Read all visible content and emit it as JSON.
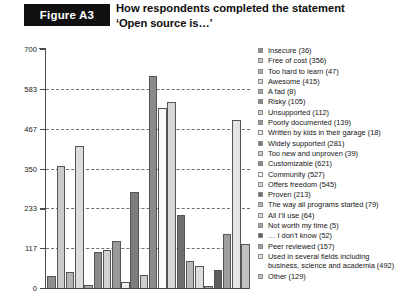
{
  "header": {
    "figure_label": "Figure A3",
    "title_line1": "How respondents completed the statement",
    "title_line2": "‘Open source is…’"
  },
  "chart_data": {
    "type": "bar",
    "title": "How respondents completed the statement ‘Open source is…’",
    "xlabel": "",
    "ylabel": "",
    "ylim": [
      0,
      700
    ],
    "yticks": [
      0,
      117,
      233,
      350,
      467,
      583,
      700
    ],
    "ytick_labels": [
      "0",
      "117",
      "233",
      "350",
      "467",
      "583",
      "700"
    ],
    "grid": true,
    "legend_position": "right",
    "categories": [
      "Insecure",
      "Free of cost",
      "Too hard to learn",
      "Awesome",
      "A fad",
      "Risky",
      "Unsupported",
      "Poorly documented",
      "Written by kids in their garage",
      "Widely supported",
      "Too new and unproven",
      "Customizable",
      "Community",
      "Offers freedom",
      "Proven",
      "The way all programs started",
      "All I’ll use",
      "Not worth my time",
      "… I don’t know",
      "Peer reviewed",
      "Used in several fields including business, science and academia",
      "Other"
    ],
    "values": [
      36,
      356,
      47,
      415,
      8,
      105,
      112,
      139,
      18,
      281,
      39,
      621,
      527,
      545,
      213,
      79,
      64,
      5,
      52,
      157,
      492,
      129
    ],
    "colors": [
      "#8f8f8f",
      "#c9c9c9",
      "#b4b4b4",
      "#dcdcdc",
      "#a8a8a8",
      "#8a8a8a",
      "#d2d2d2",
      "#9a9a9a",
      "#efefef",
      "#7d7d7d",
      "#cfcfcf",
      "#8b8b8b",
      "#fbfbfb",
      "#d7d7d7",
      "#6e6e6e",
      "#b9b9b9",
      "#dedede",
      "#a3a3a3",
      "#5d5d5d",
      "#9e9e9e",
      "#e4e4e4",
      "#c2c2c2"
    ]
  },
  "legend": {
    "items": [
      {
        "label": "Insecure (36)",
        "color": "#8f8f8f"
      },
      {
        "label": "Free of cost (356)",
        "color": "#c9c9c9"
      },
      {
        "label": "Too hard to learn (47)",
        "color": "#b4b4b4"
      },
      {
        "label": "Awesome (415)",
        "color": "#dcdcdc"
      },
      {
        "label": "A fad (8)",
        "color": "#a8a8a8"
      },
      {
        "label": "Risky (105)",
        "color": "#8a8a8a"
      },
      {
        "label": "Unsupported (112)",
        "color": "#d2d2d2"
      },
      {
        "label": "Poorly documented (139)",
        "color": "#9a9a9a"
      },
      {
        "label": "Written by kids in their garage (18)",
        "color": "#efefef"
      },
      {
        "label": "Widely supported (281)",
        "color": "#7d7d7d"
      },
      {
        "label": "Too new and unproven (39)",
        "color": "#cfcfcf"
      },
      {
        "label": "Customizable (621)",
        "color": "#8b8b8b"
      },
      {
        "label": "Community (527)",
        "color": "#fbfbfb"
      },
      {
        "label": "Offers freedom (545)",
        "color": "#d7d7d7"
      },
      {
        "label": "Proven (213)",
        "color": "#6e6e6e"
      },
      {
        "label": "The way all programs started (79)",
        "color": "#b9b9b9"
      },
      {
        "label": "All I’ll use (64)",
        "color": "#dedede"
      },
      {
        "label": "Not worth my time (5)",
        "color": "#a3a3a3"
      },
      {
        "label": "… I don’t know (52)",
        "color": "#5d5d5d"
      },
      {
        "label": "Peer reviewed (157)",
        "color": "#9e9e9e"
      },
      {
        "label": "Used in several fields including business, science and academia (492)",
        "color": "#e4e4e4"
      },
      {
        "label": "Other (129)",
        "color": "#c2c2c2"
      }
    ]
  }
}
